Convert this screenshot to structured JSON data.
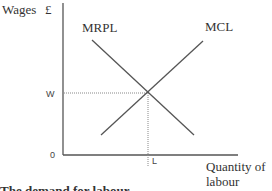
{
  "diagram": {
    "title": "The demand for labour",
    "y_axis_label": "Wages",
    "y_axis_unit": "£",
    "x_axis_label_line1": "Quantity of",
    "x_axis_label_line2": "labour",
    "origin_label": "0",
    "equilibrium_wage_label": "W",
    "equilibrium_quantity_label": "L",
    "curves": [
      {
        "name": "MRPL",
        "label": "MRPL",
        "slope": "downward"
      },
      {
        "name": "MCL",
        "label": "MCL",
        "slope": "upward"
      }
    ],
    "colors": {
      "axis": "#555555",
      "curve": "#555555",
      "guide": "#888888",
      "text": "#333333"
    }
  }
}
